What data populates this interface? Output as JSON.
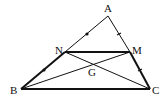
{
  "diagram": {
    "points": {
      "A": {
        "label": "A",
        "x": 108,
        "y": 16
      },
      "B": {
        "label": "B",
        "x": 21,
        "y": 89
      },
      "C": {
        "label": "C",
        "x": 150,
        "y": 89
      },
      "N": {
        "label": "N",
        "x": 65,
        "y": 52
      },
      "M": {
        "label": "M",
        "x": 130,
        "y": 52
      },
      "G": {
        "label": "G",
        "x": 94,
        "y": 63
      }
    },
    "segments": [
      {
        "from": "A",
        "to": "B",
        "style": "thin+thick"
      },
      {
        "from": "A",
        "to": "C",
        "style": "thin+thick"
      },
      {
        "from": "B",
        "to": "C",
        "style": "thick"
      },
      {
        "from": "N",
        "to": "M",
        "style": "thick"
      },
      {
        "from": "N",
        "to": "C",
        "style": "thin"
      },
      {
        "from": "B",
        "to": "M",
        "style": "thin"
      }
    ],
    "tick_marks": [
      "AN",
      "NB",
      "AM",
      "MC"
    ],
    "colors": {
      "stroke": "#111111",
      "background": "#ffffff"
    }
  }
}
